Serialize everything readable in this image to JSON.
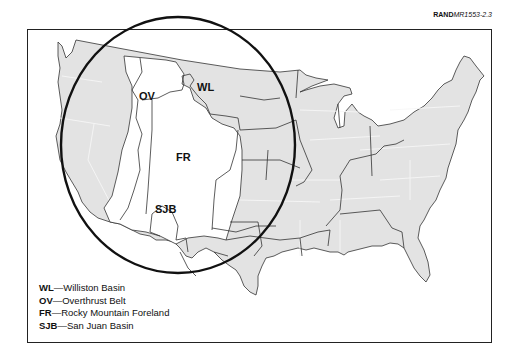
{
  "figure": {
    "publisher": "RAND",
    "figure_id": "MR1553-2.3"
  },
  "map": {
    "description": "Map of contiguous United States with oil & gas region boundaries; an ellipse encircles the Rocky Mountain basins",
    "colors": {
      "land": "#e3e3e3",
      "region_lines": "#333333",
      "state_lines": "#f4f4f4",
      "highlight_fill": "#ffffff",
      "ellipse": "#111111"
    },
    "regions": [
      {
        "code": "WL",
        "name": "Williston Basin"
      },
      {
        "code": "OV",
        "name": "Overthrust Belt"
      },
      {
        "code": "FR",
        "name": "Rocky Mountain Foreland"
      },
      {
        "code": "SJB",
        "name": "San Juan Basin"
      }
    ]
  },
  "legend": {
    "items": [
      {
        "code": "WL",
        "sep": "—",
        "name": "Williston Basin"
      },
      {
        "code": "OV",
        "sep": "—",
        "name": "Overthrust Belt"
      },
      {
        "code": "FR",
        "sep": "—",
        "name": "Rocky Mountain Foreland"
      },
      {
        "code": "SJB",
        "sep": "—",
        "name": "San Juan Basin"
      }
    ]
  }
}
